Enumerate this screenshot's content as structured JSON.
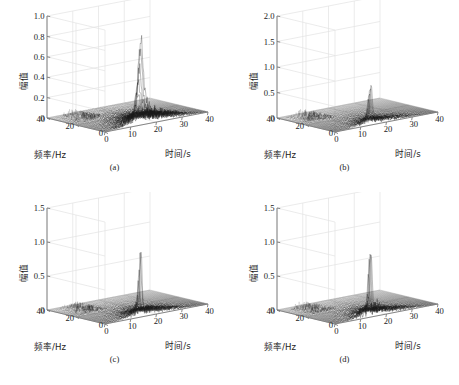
{
  "figure": {
    "title": "",
    "layout": "2x2 grid of 3D waterfall spectrogram plots",
    "background_color": "#ffffff",
    "trace_color": "#1a1a1a",
    "grid_color": "#e2e2e2",
    "axis_color": "#7a7a7a"
  },
  "labels": {
    "z_axis": "幅值",
    "x_axis": "时间/s",
    "y_axis": "频率/Hz"
  },
  "chart_data": [
    {
      "type": "line",
      "panel": "a",
      "caption": "(a)",
      "title": "",
      "xlabel": "时间/s",
      "ylabel": "频率/Hz",
      "zlabel": "幅值",
      "xlim": [
        0,
        40
      ],
      "ylim": [
        0,
        40
      ],
      "zlim": [
        0,
        1.0
      ],
      "xticks": [
        0,
        10,
        20,
        30,
        40
      ],
      "yticks": [
        0,
        20,
        40
      ],
      "zticks": [
        0,
        0.2,
        0.4,
        0.6,
        0.8,
        1.0
      ],
      "ztick_labels": [
        "0",
        "0.2",
        "0.4",
        "0.6",
        "0.8",
        "1.0"
      ],
      "grid": true,
      "legend": "none",
      "peak_amplitude": 0.72,
      "peak_time_s": 14,
      "peak_frequency_hz": 7,
      "noise_floor": 0.05,
      "description": "Dense broadband noise ridge along low frequency with one broad dominant peak near 0.72"
    },
    {
      "type": "line",
      "panel": "b",
      "caption": "(b)",
      "title": "",
      "xlabel": "时间/s",
      "ylabel": "频率/Hz",
      "zlabel": "幅值",
      "xlim": [
        0,
        40
      ],
      "ylim": [
        0,
        40
      ],
      "zlim": [
        0,
        2.0
      ],
      "xticks": [
        0,
        10,
        20,
        30,
        40
      ],
      "yticks": [
        0,
        20,
        40
      ],
      "zticks": [
        0,
        0.5,
        1.0,
        1.5,
        2.0
      ],
      "ztick_labels": [
        "0",
        "0.5",
        "1.0",
        "1.5",
        "2.0"
      ],
      "grid": true,
      "legend": "none",
      "peak_amplitude": 0.78,
      "peak_time_s": 14,
      "peak_frequency_hz": 7,
      "noise_floor": 0.04,
      "description": "Narrow sharp peak near 0.78 with a secondary comb of low-amplitude harmonics at high frequency"
    },
    {
      "type": "line",
      "panel": "c",
      "caption": "(c)",
      "title": "",
      "xlabel": "时间/s",
      "ylabel": "频率/Hz",
      "zlabel": "幅值",
      "xlim": [
        0,
        40
      ],
      "ylim": [
        0,
        40
      ],
      "zlim": [
        0,
        1.5
      ],
      "xticks": [
        0,
        10,
        20,
        30,
        40
      ],
      "yticks": [
        0,
        20,
        40
      ],
      "zticks": [
        0,
        0.5,
        1.0,
        1.5
      ],
      "ztick_labels": [
        "0",
        "0.5",
        "1.0",
        "1.5"
      ],
      "grid": true,
      "legend": "none",
      "peak_amplitude": 0.84,
      "peak_time_s": 14,
      "peak_frequency_hz": 7,
      "noise_floor": 0.04,
      "description": "Single tall narrow spike near 0.84 over a dense low-level noise carpet"
    },
    {
      "type": "line",
      "panel": "d",
      "caption": "(d)",
      "title": "",
      "xlabel": "时间/s",
      "ylabel": "频率/Hz",
      "zlabel": "幅值",
      "xlim": [
        0,
        40
      ],
      "ylim": [
        0,
        40
      ],
      "zlim": [
        0,
        1.5
      ],
      "xticks": [
        0,
        10,
        20,
        30,
        40
      ],
      "yticks": [
        0,
        20,
        40
      ],
      "zticks": [
        0,
        0.5,
        1.0,
        1.5
      ],
      "ztick_labels": [
        "0",
        "0.5",
        "1.0",
        "1.5"
      ],
      "grid": true,
      "legend": "none",
      "peak_amplitude": 1.0,
      "peak_time_s": 14,
      "peak_frequency_hz": 7,
      "noise_floor": 0.04,
      "description": "Tallest narrow spike reaching 1.0 with dense dark noise cluster at its base"
    }
  ]
}
